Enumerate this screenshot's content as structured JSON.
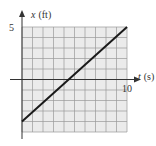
{
  "chart_data": {
    "type": "line",
    "title": "",
    "xlabel": "t (s)",
    "ylabel": "x (ft)",
    "xlabel_var": "t",
    "xlabel_unit": "(s)",
    "ylabel_var": "x",
    "ylabel_unit": "(ft)",
    "xlim": [
      0,
      10
    ],
    "ylim": [
      -5,
      5
    ],
    "grid": true,
    "grid_step": 1,
    "tick_labels": {
      "x": [
        "10"
      ],
      "y": [
        "5"
      ]
    },
    "series": [
      {
        "name": "x(t)",
        "x": [
          0,
          10
        ],
        "y": [
          -4,
          5
        ]
      }
    ],
    "colors": {
      "background": "#ebebeb",
      "grid": "#9a9a9a",
      "line": "#1a1a1a",
      "axis": "#333333"
    }
  }
}
